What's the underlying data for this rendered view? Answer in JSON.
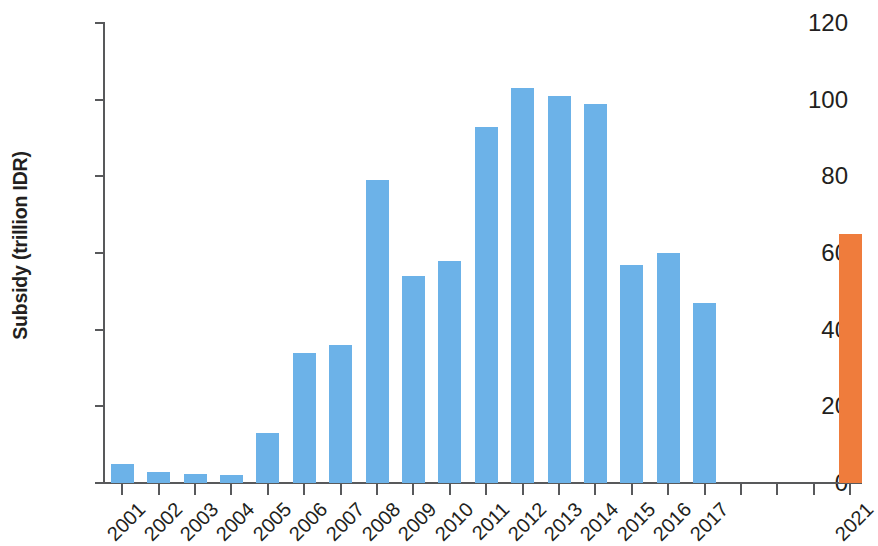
{
  "chart_data": {
    "type": "bar",
    "title": "",
    "xlabel": "",
    "ylabel": "Subsidy (trillion IDR)",
    "ylim": [
      0,
      120
    ],
    "yticks": [
      0,
      20,
      40,
      60,
      80,
      100,
      120
    ],
    "grid": false,
    "legend": "none",
    "categories": [
      "2001",
      "2002",
      "2003",
      "2004",
      "2005",
      "2006",
      "2007",
      "2008",
      "2009",
      "2010",
      "2011",
      "2012",
      "2013",
      "2014",
      "2015",
      "2016",
      "2017",
      "",
      "",
      "",
      "2021"
    ],
    "tick_labels": [
      "2001",
      "2002",
      "2003",
      "2004",
      "2005",
      "2006",
      "2007",
      "2008",
      "2009",
      "2010",
      "2011",
      "2012",
      "2013",
      "2014",
      "2015",
      "2016",
      "2017",
      "",
      "",
      "",
      "2021"
    ],
    "values": [
      5,
      3,
      2.3,
      2,
      13,
      34,
      36,
      79,
      54,
      58,
      93,
      103,
      101,
      99,
      57,
      60,
      47,
      null,
      null,
      null,
      65
    ],
    "bar_colors": [
      "#6cb2e8",
      "#6cb2e8",
      "#6cb2e8",
      "#6cb2e8",
      "#6cb2e8",
      "#6cb2e8",
      "#6cb2e8",
      "#6cb2e8",
      "#6cb2e8",
      "#6cb2e8",
      "#6cb2e8",
      "#6cb2e8",
      "#6cb2e8",
      "#6cb2e8",
      "#6cb2e8",
      "#6cb2e8",
      "#6cb2e8",
      null,
      null,
      null,
      "#ef7c3c"
    ],
    "colors": {
      "historical": "#6cb2e8",
      "projection": "#ef7c3c",
      "axis": "#58595b",
      "text": "#231f20",
      "background": "#ffffff"
    }
  }
}
